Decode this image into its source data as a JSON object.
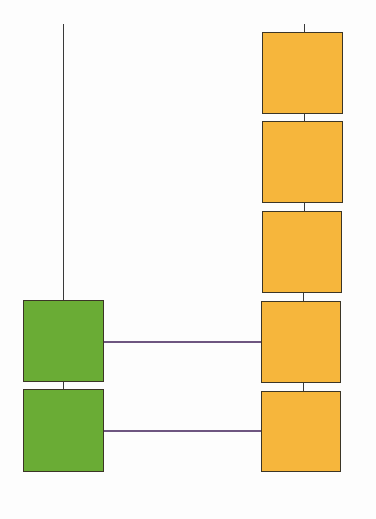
{
  "diagram": {
    "type": "two-column linked block chain",
    "colors": {
      "green": "#6aac35",
      "orange": "#f6b63c",
      "link": "#6e5680",
      "stem": "#3a3a3a",
      "border": "#3b3526",
      "background": "#fdfdfd"
    },
    "left_column": {
      "stem": {
        "x": 63,
        "y1": 24,
        "y2": 300
      },
      "blocks": [
        {
          "id": "green-1",
          "color": "green",
          "x": 23,
          "y": 300,
          "w": 81,
          "h": 82
        },
        {
          "id": "green-2",
          "color": "green",
          "x": 23,
          "y": 389,
          "w": 81,
          "h": 83
        }
      ]
    },
    "right_column": {
      "stem": {
        "x": 304,
        "y1": 24,
        "y2": 32
      },
      "blocks": [
        {
          "id": "orange-1",
          "color": "orange",
          "x": 262,
          "y": 32,
          "w": 81,
          "h": 82
        },
        {
          "id": "orange-2",
          "color": "orange",
          "x": 262,
          "y": 121,
          "w": 81,
          "h": 82
        },
        {
          "id": "orange-3",
          "color": "orange",
          "x": 262,
          "y": 211,
          "w": 80,
          "h": 82
        },
        {
          "id": "orange-4",
          "color": "orange",
          "x": 261,
          "y": 301,
          "w": 80,
          "h": 82
        },
        {
          "id": "orange-5",
          "color": "orange",
          "x": 261,
          "y": 391,
          "w": 80,
          "h": 81
        }
      ]
    },
    "links": [
      {
        "from": "green-1",
        "to": "orange-4",
        "y": 341
      },
      {
        "from": "green-2",
        "to": "orange-5",
        "y": 430
      }
    ]
  }
}
